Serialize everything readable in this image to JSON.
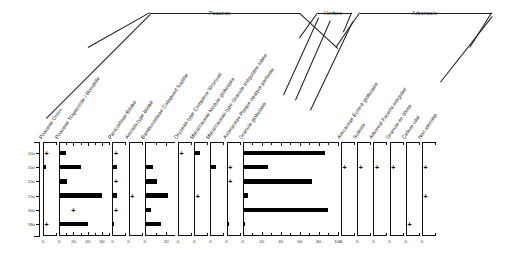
{
  "figure": {
    "kind": "phytolith-stratigraphic-diagram",
    "depth_axis_label": "",
    "trace_symbol": "+"
  },
  "groups": [
    {
      "name": "Poaceae",
      "label": "Poaceae"
    },
    {
      "name": "Herbes",
      "label": "Herbes"
    },
    {
      "name": "Arboricole",
      "label": "Arboricole"
    }
  ],
  "depths": [
    "10x",
    "50x",
    "20x",
    "25x",
    "34x",
    "38x"
  ],
  "chart_data": {
    "type": "bar",
    "title": "",
    "xlabel": "",
    "ylabel": "",
    "orientation": "horizontal",
    "categories": [
      "10x",
      "50x",
      "20x",
      "25x",
      "34x",
      "38x"
    ],
    "groups": [
      "Poaceae",
      "Poaceae",
      "Poaceae",
      "Poaceae",
      "Poaceae",
      "Poaceae",
      "Poaceae",
      "Herbes",
      "Herbes",
      "Herbes",
      "Arboricole",
      "Arboricole",
      "Arboricole",
      "Arboricole",
      "Arboricole",
      "Arboricole"
    ],
    "series": [
      {
        "name": "Poaceae Cross",
        "xlim": [
          0,
          10
        ],
        "ticks": [
          0
        ],
        "ticklabels": [
          "0"
        ],
        "values": [
          0,
          2.5,
          0,
          0,
          0,
          0
        ],
        "traces": [
          true,
          false,
          false,
          false,
          false,
          true
        ]
      },
      {
        "name": "Poaceae Trapezoïde / Rondelle",
        "xlim": [
          0,
          70
        ],
        "ticks": [
          0,
          20,
          40,
          60
        ],
        "ticklabels": [
          "0",
          "20",
          "40",
          "60"
        ],
        "values": [
          10,
          30,
          11,
          60,
          0,
          41
        ],
        "traces": [
          false,
          false,
          false,
          false,
          true,
          false
        ]
      },
      {
        "name": "Panicoideae Bilobé",
        "xlim": [
          0,
          10
        ],
        "ticks": [
          0
        ],
        "ticklabels": [
          "0"
        ],
        "values": [
          0,
          3.2,
          0,
          3.4,
          0,
          1.2
        ],
        "traces": [
          true,
          false,
          true,
          false,
          true,
          false
        ]
      },
      {
        "name": "Aristida-type bilobé",
        "xlim": [
          0,
          10
        ],
        "ticks": [
          0
        ],
        "ticklabels": [
          "0"
        ],
        "values": [
          0,
          0,
          0,
          0,
          0,
          0
        ],
        "traces": [
          false,
          false,
          false,
          true,
          false,
          false
        ]
      },
      {
        "name": "Bambusoideae Collapsed Saddle",
        "xlim": [
          0,
          28
        ],
        "ticks": [
          0,
          20
        ],
        "ticklabels": [
          "0",
          "20"
        ],
        "values": [
          0,
          8,
          11,
          22,
          6,
          15
        ],
        "traces": [
          false,
          false,
          false,
          false,
          false,
          false
        ]
      },
      {
        "name": "Oryzeae-type Complexe Shortcell",
        "xlim": [
          0,
          10
        ],
        "ticks": [
          0
        ],
        "ticklabels": [
          "0"
        ],
        "values": [
          0,
          0,
          0,
          0,
          0,
          0
        ],
        "traces": [
          true,
          false,
          false,
          false,
          false,
          false
        ]
      },
      {
        "name": "Marantaceae Nodule globulaire",
        "xlim": [
          0,
          10
        ],
        "ticks": [
          0
        ],
        "ticklabels": [
          "0"
        ],
        "values": [
          4.5,
          0,
          0,
          0,
          0,
          0
        ],
        "traces": [
          false,
          false,
          false,
          true,
          false,
          false
        ]
      },
      {
        "name": "Marantaceae-type Granule irrégulaire lobée",
        "xlim": [
          0,
          10
        ],
        "ticks": [
          0
        ],
        "ticklabels": [
          "0"
        ],
        "values": [
          0,
          4.0,
          0,
          0,
          0,
          0
        ],
        "traces": [
          false,
          false,
          false,
          false,
          false,
          false
        ]
      },
      {
        "name": "Asteraceae Plaque opaque perforée",
        "xlim": [
          0,
          10
        ],
        "ticks": [
          0
        ],
        "ticklabels": [
          "0"
        ],
        "values": [
          0,
          0,
          0,
          0,
          0,
          1.6
        ],
        "traces": [
          false,
          true,
          true,
          false,
          false,
          false
        ]
      },
      {
        "name": "Granule globulaire",
        "xlim": [
          0,
          100
        ],
        "ticks": [
          0,
          20,
          40,
          60,
          80,
          100
        ],
        "ticklabels": [
          "0",
          "20",
          "40",
          "60",
          "80",
          "100"
        ],
        "values": [
          87,
          27,
          73,
          5,
          90,
          2
        ],
        "traces": [
          false,
          false,
          false,
          false,
          false,
          false
        ]
      },
      {
        "name": "Arecaceae Échiné globulaire",
        "xlim": [
          0,
          10
        ],
        "ticks": [
          0
        ],
        "ticklabels": [
          "0"
        ],
        "values": [
          0,
          0,
          0,
          0,
          0,
          0
        ],
        "traces": [
          false,
          true,
          false,
          false,
          false,
          false
        ]
      },
      {
        "name": "Sclérite",
        "xlim": [
          0,
          10
        ],
        "ticks": [
          0
        ],
        "ticklabels": [
          "0"
        ],
        "values": [
          0,
          0,
          0,
          0,
          0,
          0
        ],
        "traces": [
          false,
          true,
          false,
          false,
          false,
          false
        ]
      },
      {
        "name": "Arboreal Facette irrégulier",
        "xlim": [
          0,
          10
        ],
        "ticks": [
          0
        ],
        "ticklabels": [
          "0"
        ],
        "values": [
          0,
          0,
          0,
          0,
          0,
          0
        ],
        "traces": [
          false,
          true,
          false,
          false,
          false,
          false
        ]
      },
      {
        "name": "Granule en dôme",
        "xlim": [
          0,
          10
        ],
        "ticks": [
          0
        ],
        "ticklabels": [
          "0"
        ],
        "values": [
          0,
          0,
          0,
          0,
          0,
          0
        ],
        "traces": [
          false,
          true,
          false,
          false,
          false,
          false
        ]
      },
      {
        "name": "Cellule cilié",
        "xlim": [
          0,
          10
        ],
        "ticks": [
          0
        ],
        "ticklabels": [
          "0"
        ],
        "values": [
          0,
          0,
          0,
          0,
          0,
          0
        ],
        "traces": [
          false,
          false,
          false,
          false,
          false,
          true
        ]
      },
      {
        "name": "Non identifié",
        "xlim": [
          0,
          10
        ],
        "ticks": [
          0
        ],
        "ticklabels": [
          "0"
        ],
        "values": [
          0,
          0,
          0,
          0,
          0,
          0
        ],
        "traces": [
          false,
          true,
          false,
          true,
          false,
          false
        ]
      }
    ]
  }
}
